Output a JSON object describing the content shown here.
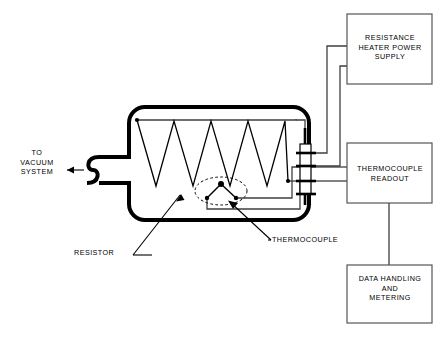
{
  "diagram": {
    "stroke_color": "#000000",
    "wire_color": "#3a3a3a",
    "background": "#ffffff",
    "boxes": [
      {
        "id": "resistance-heater-power-supply",
        "label": "RESISTANCE\nHEATER POWER\nSUPPLY"
      },
      {
        "id": "thermocouple-readout",
        "label": "THERMOCOUPLE\nREADOUT"
      },
      {
        "id": "data-handling-and-metering",
        "label": "DATA HANDLING\nAND\nMETERING"
      }
    ],
    "callouts": [
      {
        "id": "vacuum-port",
        "label": "TO\nVACUUM\nSYSTEM"
      },
      {
        "id": "resistor",
        "label": "RESISTOR"
      },
      {
        "id": "thermocouple",
        "label": "THERMOCOUPLE"
      }
    ],
    "components": {
      "chamber": {
        "name": "vacuum-chamber",
        "wall_thickness": 4,
        "corner_radius": 16
      },
      "resistor_coil": {
        "name": "resistor-zigzag-coil",
        "peaks": 8
      },
      "thermocouple_junction": {
        "name": "thermocouple-junction",
        "marker": "dashed-ellipse"
      },
      "feedthrough": {
        "name": "electrical-feedthrough",
        "terminals": 4
      },
      "bellows": {
        "name": "vacuum-bellows",
        "shape": "s-curve"
      }
    }
  }
}
